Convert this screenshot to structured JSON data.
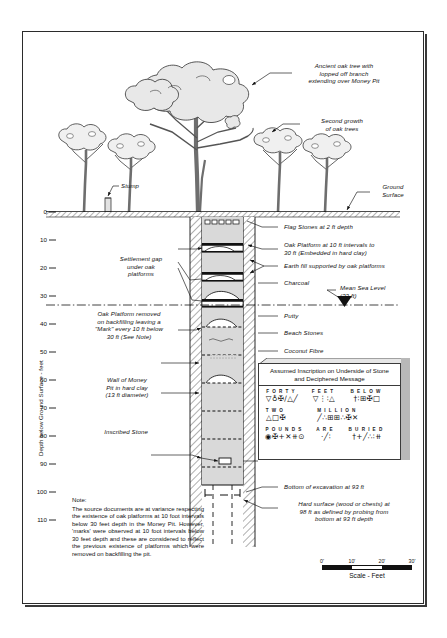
{
  "axis": {
    "title": "Depth below Ground Surface - feet",
    "ticks": [
      "0",
      "10",
      "20",
      "30",
      "40",
      "50",
      "60",
      "70",
      "80",
      "90",
      "100",
      "110"
    ]
  },
  "annotations": {
    "ancient_oak": "Ancient oak tree with\nlopped off branch\nextending over Money Pit",
    "second_growth": "Second growth\nof oak trees",
    "stump": "Stump",
    "ground_surface": "Ground\nSurface",
    "flag_stones": "Flag Stones at 2 ft depth",
    "oak_platform": "Oak Platform at 10 ft intervals to\n30 ft (Embedded in hard clay)",
    "earth_fill": "Earth fill supported by oak platforms",
    "charcoal": "Charcoal",
    "mean_sea_level": "Mean Sea Level\n(33 ft)",
    "putty": "Putty",
    "beach_stones": "Beach Stones",
    "coconut_fibre": "Coconut Fibre",
    "settlement_gap": "Settlement gap\nunder oak\nplatforms",
    "platform_removed": "Oak Platform removed\non backfilling leaving a\n\"Mark\" every 10 ft below\n30 ft (See Note)",
    "wall_of_pit": "Wall of Money\nPit in hard clay\n(13 ft diameter)",
    "inscribed_stone": "Inscribed Stone",
    "bottom_excavation": "Bottom of excavation at 93 ft",
    "hard_surface": "Hard surface (wood or chests) at\n98 ft as defined by probing from\nbottom at 93 ft depth"
  },
  "note": {
    "heading": "Note:",
    "body": "The source documents are at variance respecting the existence of oak platforms at 10 foot intervals below 30 feet depth in the Money Pit. However, 'marks' were observed at 10 foot intervals below 30 feet depth and these are considered to reflect the previous existence of platforms which were removed on backfilling the pit."
  },
  "inscription": {
    "title": "Assumed Inscription on Underside of Stone\nand Deciphered Message",
    "rows": [
      {
        "words": [
          {
            "plain": "FORTY",
            "symbols": "▽♁✠∕△╱"
          },
          {
            "plain": "FEET",
            "symbols": "▽⋮∶△"
          },
          {
            "plain": "BELOW",
            "symbols": "†∶⊞✠□"
          }
        ]
      },
      {
        "words": [
          {
            "plain": "TWO",
            "symbols": "△□✠"
          },
          {
            "plain": "MILLION",
            "symbols": "╱∴⊞⊞∴✠✕"
          }
        ]
      },
      {
        "words": [
          {
            "plain": "POUNDS",
            "symbols": "◉✠+✕⧺⊙"
          },
          {
            "plain": "ARE",
            "symbols": "·╱∶"
          },
          {
            "plain": "BURIED",
            "symbols": "†+╱∴∶⧺"
          }
        ]
      }
    ]
  },
  "scale": {
    "ticks": [
      "0'",
      "10'",
      "20'",
      "30'"
    ],
    "caption": "Scale - Feet"
  },
  "colors": {
    "ink": "#1a1a1a",
    "fill": "#d9d9d9",
    "panel_side": "#b8b8b8"
  }
}
